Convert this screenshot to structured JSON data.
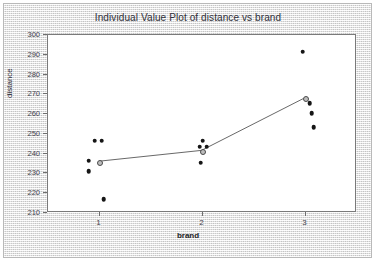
{
  "chart_data": {
    "type": "scatter",
    "title": "Individual Value Plot of distance vs brand",
    "xlabel": "brand",
    "ylabel": "distance",
    "grid": false,
    "legend": null,
    "xlim": [
      0.5,
      3.5
    ],
    "ylim": [
      210,
      300
    ],
    "x_categories": [
      "1",
      "2",
      "3"
    ],
    "x_tick_labels": [
      "1",
      "2",
      "3"
    ],
    "y_tick_labels": [
      "300",
      "290",
      "280",
      "270",
      "260",
      "250",
      "240",
      "230",
      "220",
      "210"
    ],
    "y_tick_values": [
      300,
      290,
      280,
      270,
      260,
      250,
      240,
      230,
      220,
      210
    ],
    "series": [
      {
        "name": "individual values",
        "marker": "filled-circle",
        "color": "#161616",
        "points": [
          {
            "x": 1,
            "y": 246.5
          },
          {
            "x": 1,
            "y": 246.5
          },
          {
            "x": 1,
            "y": 236.5
          },
          {
            "x": 1,
            "y": 231.0
          },
          {
            "x": 1,
            "y": 217.0
          },
          {
            "x": 2,
            "y": 246.5
          },
          {
            "x": 2,
            "y": 243.5
          },
          {
            "x": 2,
            "y": 243.5
          },
          {
            "x": 2,
            "y": 241.0
          },
          {
            "x": 2,
            "y": 235.5
          },
          {
            "x": 3,
            "y": 291.5
          },
          {
            "x": 3,
            "y": 265.5
          },
          {
            "x": 3,
            "y": 260.5
          },
          {
            "x": 3,
            "y": 253.5
          },
          {
            "x": 3,
            "y": 267.5
          }
        ]
      },
      {
        "name": "group means",
        "marker": "open-circle",
        "color": "#bdbdbd",
        "connected": true,
        "points": [
          {
            "x": 1,
            "y": 235.5
          },
          {
            "x": 2,
            "y": 241.0
          },
          {
            "x": 3,
            "y": 267.5
          }
        ]
      }
    ]
  }
}
